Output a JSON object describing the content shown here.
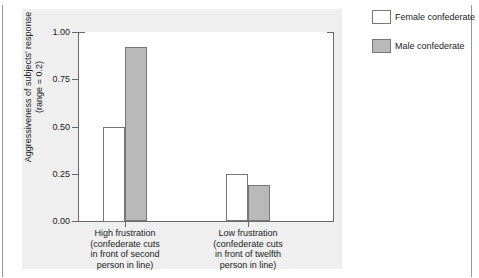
{
  "figure": {
    "clipped_top_caption": "",
    "background_color": "#ffffff",
    "panel_color": "#efefef"
  },
  "legend": {
    "position": "top-right",
    "entries": [
      {
        "label": "Female confederate",
        "swatch": "white-square-swatch",
        "color": "#ffffff"
      },
      {
        "label": "Male confederate",
        "swatch": "grey-square-swatch",
        "color": "#b9b9b9"
      }
    ]
  },
  "chart_data": {
    "type": "bar",
    "title": "",
    "xlabel": "",
    "ylabel": "Aggressiveness of subjects' response (range = 0.2)",
    "ylabel_line1": "Aggressiveness of subjects' response",
    "ylabel_line2": "(range = 0.2)",
    "ylim": [
      0.0,
      1.0
    ],
    "ytick_labels": [
      "0.00",
      "0.25",
      "0.50",
      "0.75",
      "1.00"
    ],
    "ytick_values": [
      0.0,
      0.25,
      0.5,
      0.75,
      1.0
    ],
    "grid": false,
    "legend_position": "top-right",
    "categories": [
      "High frustration (confederate cuts in front of second person in line)",
      "Low frustration (confederate cuts in front of twelfth person in line)"
    ],
    "category_lines": [
      [
        "High frustration",
        "(confederate cuts",
        "in front of second",
        "person in line)"
      ],
      [
        "Low frustration",
        "(confederate cuts",
        "in front of twelfth",
        "person in line)"
      ]
    ],
    "series": [
      {
        "name": "Female confederate",
        "color": "#ffffff",
        "values": [
          0.5,
          0.25
        ]
      },
      {
        "name": "Male confederate",
        "color": "#b9b9b9",
        "values": [
          0.92,
          0.19
        ]
      }
    ]
  }
}
